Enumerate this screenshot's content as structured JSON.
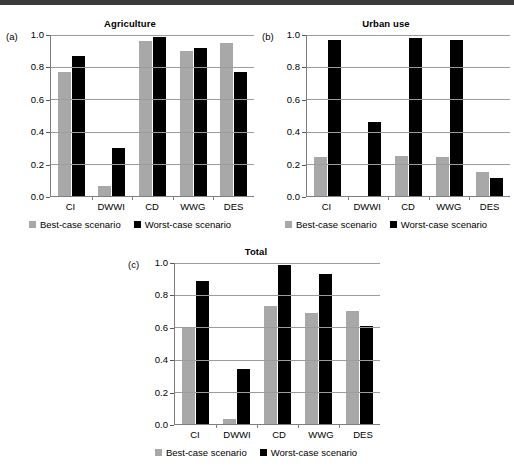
{
  "figure": {
    "panels": [
      {
        "tag": "(a)",
        "title": "Agriculture",
        "legend": {
          "best": "Best-case scenario",
          "worst": "Worst-case scenario"
        }
      },
      {
        "tag": "(b)",
        "title": "Urban use",
        "legend": {
          "best": "Best-case scenario",
          "worst": "Worst-case scenario"
        }
      },
      {
        "tag": "(c)",
        "title": "Total",
        "legend": {
          "best": "Best-case scenario",
          "worst": "Worst-case scenario"
        }
      }
    ],
    "colors": {
      "best": "#a8a8a8",
      "worst": "#000000",
      "grid": "#9c9c9c",
      "axis": "#7f7f7f"
    }
  },
  "chart_data": [
    {
      "type": "bar",
      "title": "Agriculture",
      "panel_tag": "(a)",
      "xlabel": "",
      "ylabel": "",
      "ylim": [
        0.0,
        1.0
      ],
      "yticks": [
        "1.0",
        "0.8",
        "0.6",
        "0.4",
        "0.2",
        "0.0"
      ],
      "ytick_values": [
        1.0,
        0.8,
        0.6,
        0.4,
        0.2,
        0.0
      ],
      "grid": true,
      "legend_position": "below",
      "categories": [
        "CI",
        "DWWI",
        "CD",
        "WWG",
        "DES"
      ],
      "series": [
        {
          "name": "Best-case scenario",
          "color": "#a8a8a8",
          "values": [
            0.77,
            0.06,
            0.96,
            0.9,
            0.95
          ]
        },
        {
          "name": "Worst-case scenario",
          "color": "#000000",
          "values": [
            0.87,
            0.3,
            0.99,
            0.92,
            0.77
          ]
        }
      ]
    },
    {
      "type": "bar",
      "title": "Urban use",
      "panel_tag": "(b)",
      "xlabel": "",
      "ylabel": "",
      "ylim": [
        0.0,
        1.0
      ],
      "yticks": [
        "1.0",
        "0.8",
        "0.6",
        "0.4",
        "0.2",
        "0.0"
      ],
      "ytick_values": [
        1.0,
        0.8,
        0.6,
        0.4,
        0.2,
        0.0
      ],
      "grid": true,
      "legend_position": "below",
      "categories": [
        "CI",
        "DWWI",
        "CD",
        "WWG",
        "DES"
      ],
      "series": [
        {
          "name": "Best-case scenario",
          "color": "#a8a8a8",
          "values": [
            0.24,
            0.0,
            0.25,
            0.24,
            0.15
          ]
        },
        {
          "name": "Worst-case scenario",
          "color": "#000000",
          "values": [
            0.97,
            0.46,
            0.98,
            0.97,
            0.11
          ]
        }
      ]
    },
    {
      "type": "bar",
      "title": "Total",
      "panel_tag": "(c)",
      "xlabel": "",
      "ylabel": "",
      "ylim": [
        0.0,
        1.0
      ],
      "yticks": [
        "1.0",
        "0.8",
        "0.6",
        "0.4",
        "0.2",
        "0.0"
      ],
      "ytick_values": [
        1.0,
        0.8,
        0.6,
        0.4,
        0.2,
        0.0
      ],
      "grid": true,
      "legend_position": "below",
      "categories": [
        "CI",
        "DWWI",
        "CD",
        "WWG",
        "DES"
      ],
      "series": [
        {
          "name": "Best-case scenario",
          "color": "#a8a8a8",
          "values": [
            0.6,
            0.03,
            0.73,
            0.69,
            0.7
          ]
        },
        {
          "name": "Worst-case scenario",
          "color": "#000000",
          "values": [
            0.89,
            0.34,
            0.99,
            0.93,
            0.61
          ]
        }
      ]
    }
  ]
}
